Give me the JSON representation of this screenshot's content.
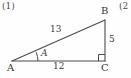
{
  "figure": {
    "kind": "right-triangle",
    "stroke_color": "#4a4a4a",
    "background_color": "#fefefe",
    "text_color": "#3a3a3a",
    "problem_numbers": {
      "left": "(1)",
      "right": "(2"
    },
    "vertices": [
      {
        "id": "A",
        "label": "A",
        "x": 12,
        "y": 61
      },
      {
        "id": "B",
        "label": "B",
        "x": 105,
        "y": 20
      },
      {
        "id": "C",
        "label": "C",
        "x": 105,
        "y": 61
      }
    ],
    "sides": [
      {
        "id": "AB",
        "label": "13",
        "from": "A",
        "to": "B",
        "role": "hypotenuse"
      },
      {
        "id": "BC",
        "label": "5",
        "from": "B",
        "to": "C",
        "role": "opposite"
      },
      {
        "id": "AC",
        "label": "12",
        "from": "A",
        "to": "C",
        "role": "adjacent"
      }
    ],
    "angles": [
      {
        "id": "angle-A",
        "label": "A",
        "at": "A",
        "marker": "arc",
        "italic": true
      },
      {
        "id": "angle-C",
        "label": "",
        "at": "C",
        "marker": "right-angle-square"
      }
    ]
  }
}
